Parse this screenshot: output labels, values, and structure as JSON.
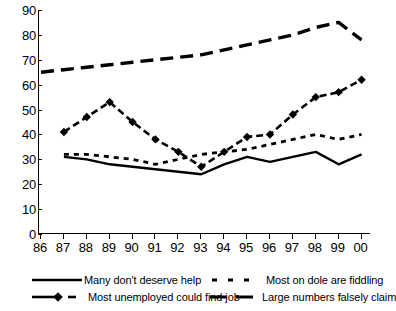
{
  "chart_data": {
    "type": "line",
    "title": "",
    "subtitle": "",
    "xlabel": "",
    "ylabel": "",
    "ylim": [
      0,
      90
    ],
    "ytick_step": 10,
    "yticks": [
      0,
      10,
      20,
      30,
      40,
      50,
      60,
      70,
      80,
      90
    ],
    "grid": false,
    "legend_position": "bottom",
    "categories": [
      "86",
      "87",
      "88",
      "89",
      "90",
      "91",
      "92",
      "93",
      "94",
      "95",
      "96",
      "97",
      "98",
      "99",
      "00"
    ],
    "series": [
      {
        "name": "Many don't deserve help",
        "style": "solid",
        "marker": "none",
        "color": "#000000",
        "values": [
          null,
          31,
          30,
          28,
          27,
          26,
          25,
          24,
          28,
          31,
          29,
          31,
          33,
          28,
          32
        ]
      },
      {
        "name": "Most on dole are fiddling",
        "style": "dashed",
        "marker": "none",
        "color": "#000000",
        "values": [
          null,
          32,
          32,
          31,
          30,
          28,
          30,
          32,
          33,
          34,
          36,
          38,
          40,
          38,
          40
        ]
      },
      {
        "name": "Most unemployed could find job",
        "style": "dashed",
        "marker": "diamond",
        "color": "#000000",
        "values": [
          null,
          41,
          47,
          53,
          45,
          38,
          33,
          27,
          33,
          39,
          40,
          48,
          55,
          57,
          62
        ]
      },
      {
        "name": "Large numbers falsely claim",
        "style": "long-dashed",
        "marker": "none",
        "color": "#000000",
        "values": [
          65,
          66,
          67,
          68,
          69,
          70,
          71,
          72,
          74,
          76,
          78,
          80,
          83,
          85,
          78
        ]
      }
    ]
  },
  "axes": {
    "y_tick_labels": [
      "90",
      "80",
      "70",
      "60",
      "50",
      "40",
      "30",
      "20",
      "10",
      "0"
    ],
    "x_tick_labels": [
      "86",
      "87",
      "88",
      "89",
      "90",
      "91",
      "92",
      "93",
      "94",
      "95",
      "96",
      "97",
      "98",
      "99",
      "00"
    ]
  },
  "legend": {
    "entries": [
      {
        "label": "Many don't deserve help",
        "swatch": "solid-line-swatch"
      },
      {
        "label": "Most on dole are fiddling",
        "swatch": "dashed-line-swatch"
      },
      {
        "label": "Most unemployed could find job",
        "swatch": "diamond-dashed-line-swatch"
      },
      {
        "label": "Large numbers falsely claim",
        "swatch": "thick-dashed-line-swatch"
      }
    ]
  },
  "colors": {
    "ink": "#000000",
    "background": "#ffffff"
  }
}
